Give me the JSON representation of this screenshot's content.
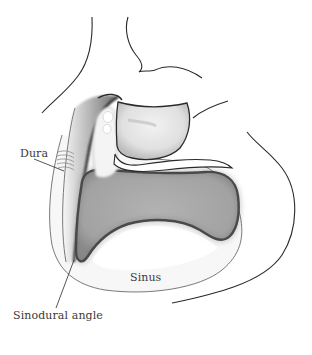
{
  "figure": {
    "type": "anatomical-illustration",
    "labels": {
      "dura": "Dura",
      "sinus": "Sinus",
      "sinodural_angle": "Sinodural angle"
    },
    "colors": {
      "outline": "#2a2a2a",
      "sinus_fill": "#a6a6a6",
      "sinus_edge": "#3c3c3c",
      "background": "#ffffff"
    }
  }
}
